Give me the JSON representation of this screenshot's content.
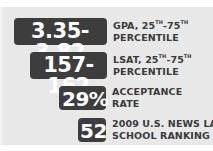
{
  "stats": [
    {
      "value": "3.35-3.82",
      "label_line1_pre": "GPA, 25",
      "label_line1_sup1": "TH",
      "label_line1_mid": "-75",
      "label_line1_sup2": "TH",
      "label_line2": "PERCENTILE"
    },
    {
      "value": "157-162",
      "label_line1_pre": "LSAT, 25",
      "label_line1_sup1": "TH",
      "label_line1_mid": "-75",
      "label_line1_sup2": "TH",
      "label_line2": "PERCENTILE"
    },
    {
      "value": "29%",
      "label_line1": "ACCEPTANCE",
      "label_line2": "RATE"
    },
    {
      "value": "52",
      "label_line1": "2009 U.S. NEWS LAW",
      "label_line2": "SCHOOL RANKING"
    }
  ],
  "colors": {
    "panel_background": "#e8e8e8",
    "badge_background": "#3d3d3d",
    "badge_text": "#ffffff",
    "label_text": "#3a3a3a"
  }
}
